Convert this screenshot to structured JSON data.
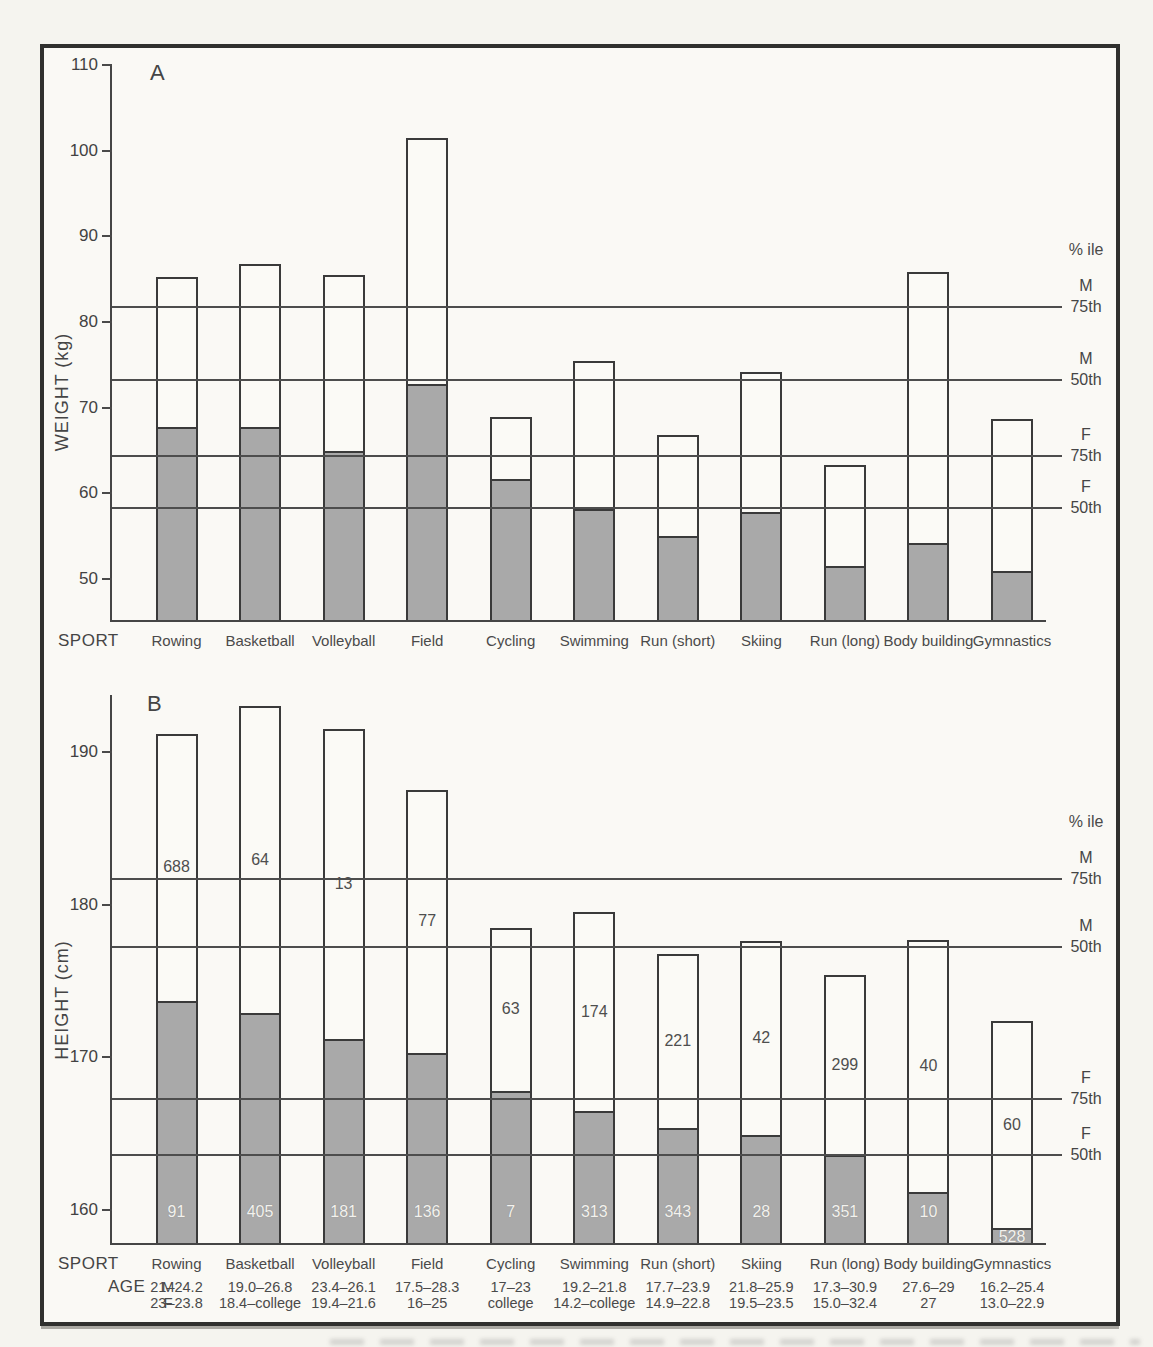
{
  "labels": {
    "sport_row": "SPORT",
    "age_row": "AGE",
    "male_symbol": "M",
    "female_symbol": "F",
    "percentile_header": "% ile"
  },
  "sports": [
    "Rowing",
    "Basketball",
    "Volleyball",
    "Field",
    "Cycling",
    "Swimming",
    "Run (short)",
    "Skiing",
    "Run (long)",
    "Body building",
    "Gymnastics"
  ],
  "ages": {
    "male": [
      "21–24.2",
      "19.0–26.8",
      "23.4–26.1",
      "17.5–28.3",
      "17–23",
      "19.2–21.8",
      "17.7–23.9",
      "21.8–25.9",
      "17.3–30.9",
      "27.6–29",
      "16.2–25.4"
    ],
    "female": [
      "23–23.8",
      "18.4–college",
      "19.4–21.6",
      "16–25",
      "college",
      "14.2–college",
      "14.9–22.8",
      "19.5–23.5",
      "15.0–32.4",
      "27",
      "13.0–22.9"
    ]
  },
  "chart_data": [
    {
      "id": "weight-by-sport",
      "type": "bar",
      "panel_label": "A",
      "title": "",
      "xlabel": "SPORT",
      "ylabel": "WEIGHT (kg)",
      "yticks": [
        50,
        60,
        70,
        80,
        90,
        100,
        110
      ],
      "ylim": [
        45,
        110
      ],
      "grid": false,
      "categories": [
        "Rowing",
        "Basketball",
        "Volleyball",
        "Field",
        "Cycling",
        "Swimming",
        "Run (short)",
        "Skiing",
        "Run (long)",
        "Body building",
        "Gymnastics"
      ],
      "series": [
        {
          "name": "M",
          "style": "open",
          "values": [
            85.3,
            86.8,
            85.5,
            101.5,
            68.9,
            75.5,
            66.8,
            74.2,
            63.3,
            85.8,
            68.7
          ]
        },
        {
          "name": "F",
          "style": "shaded",
          "values": [
            67.7,
            67.7,
            65.0,
            72.8,
            61.7,
            58.2,
            55.0,
            57.8,
            51.5,
            54.2,
            50.9
          ]
        }
      ],
      "reference_lines": [
        {
          "group": "M",
          "percentile": "75th",
          "value": 81.8
        },
        {
          "group": "M",
          "percentile": "50th",
          "value": 73.2
        },
        {
          "group": "F",
          "percentile": "75th",
          "value": 64.4
        },
        {
          "group": "F",
          "percentile": "50th",
          "value": 58.3
        }
      ]
    },
    {
      "id": "height-by-sport",
      "type": "bar",
      "panel_label": "B",
      "title": "",
      "xlabel": "SPORT",
      "ylabel": "HEIGHT (cm)",
      "yticks": [
        160,
        170,
        180,
        190
      ],
      "ylim": [
        157.5,
        193.7
      ],
      "grid": false,
      "categories": [
        "Rowing",
        "Basketball",
        "Volleyball",
        "Field",
        "Cycling",
        "Swimming",
        "Run (short)",
        "Skiing",
        "Run (long)",
        "Body building",
        "Gymnastics"
      ],
      "series": [
        {
          "name": "M",
          "style": "open",
          "values": [
            191.2,
            193.0,
            191.5,
            187.5,
            178.5,
            179.5,
            176.8,
            177.6,
            175.4,
            177.7,
            172.4
          ],
          "counts": [
            688,
            64,
            13,
            77,
            63,
            174,
            221,
            42,
            299,
            40,
            60
          ]
        },
        {
          "name": "F",
          "style": "shaded",
          "values": [
            173.7,
            172.9,
            171.2,
            170.3,
            167.8,
            166.5,
            165.4,
            164.9,
            163.6,
            161.2,
            158.8
          ],
          "counts": [
            91,
            405,
            181,
            136,
            7,
            313,
            343,
            28,
            351,
            10,
            528
          ]
        }
      ],
      "reference_lines": [
        {
          "group": "M",
          "percentile": "75th",
          "value": 181.7
        },
        {
          "group": "M",
          "percentile": "50th",
          "value": 177.2
        },
        {
          "group": "F",
          "percentile": "75th",
          "value": 167.3
        },
        {
          "group": "F",
          "percentile": "50th",
          "value": 163.6
        }
      ]
    }
  ],
  "colors": {
    "ink": "#3e3e3e",
    "frame": "#30302e",
    "paper": "#faf9f5",
    "bar_outline": "#3a3a3a",
    "bar_fill_male": "#fbfaf6",
    "bar_fill_female": "#a9a9a9",
    "reference_line": "#4d4d4d",
    "count_text_female": "#f3f2ee"
  }
}
